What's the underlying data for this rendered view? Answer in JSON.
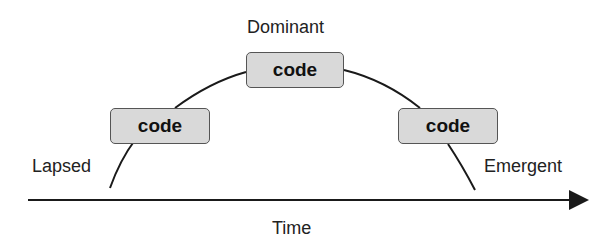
{
  "diagram": {
    "labels": {
      "top": "Dominant",
      "left": "Lapsed",
      "right": "Emergent",
      "axis": "Time"
    },
    "boxes": [
      {
        "id": "left",
        "text": "code"
      },
      {
        "id": "middle",
        "text": "code"
      },
      {
        "id": "right",
        "text": "code"
      }
    ],
    "colors": {
      "box_fill": "#d9d9d9",
      "line": "#1a1a1a"
    }
  }
}
